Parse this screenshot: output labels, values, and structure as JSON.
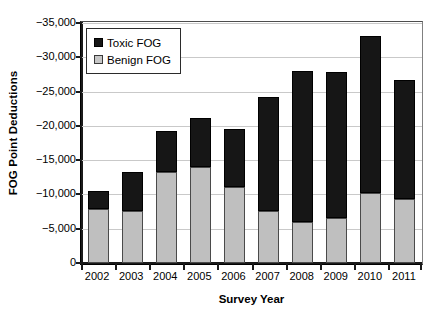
{
  "chart_data": {
    "type": "bar",
    "subtype": "stacked-vertical",
    "title": "",
    "xlabel": "Survey Year",
    "ylabel": "FOG Point Deductions",
    "categories": [
      "2002",
      "2003",
      "2004",
      "2005",
      "2006",
      "2007",
      "2008",
      "2009",
      "2010",
      "2011"
    ],
    "series": [
      {
        "name": "Benign FOG",
        "color": "#bfbfbf",
        "values": [
          -7900,
          -7600,
          -13300,
          -14000,
          -11100,
          -7600,
          -6000,
          -6600,
          -10200,
          -9300
        ]
      },
      {
        "name": "Toxic FOG",
        "color": "#161616",
        "values": [
          -2600,
          -5700,
          -5900,
          -7100,
          -8400,
          -16600,
          -22000,
          -21200,
          -22900,
          -17400
        ]
      }
    ],
    "totals": [
      -10500,
      -13300,
      -19200,
      -21100,
      -19500,
      -24200,
      -28000,
      -27800,
      -33100,
      -26700
    ],
    "ylim": [
      0,
      -35000
    ],
    "y_inverted": true,
    "yticks": [
      {
        "value": -35000,
        "label": "−35,000"
      },
      {
        "value": -30000,
        "label": "−30,000"
      },
      {
        "value": -25000,
        "label": "−25,000"
      },
      {
        "value": -20000,
        "label": "−20,000"
      },
      {
        "value": -15000,
        "label": "−15,000"
      },
      {
        "value": -10000,
        "label": "−10,000"
      },
      {
        "value": -5000,
        "label": "−5,000"
      },
      {
        "value": 0,
        "label": "0"
      }
    ],
    "grid": true,
    "grid_axis": "y",
    "legend": {
      "position": "upper-left-inside",
      "entries": [
        {
          "label": "Toxic FOG",
          "color": "#161616"
        },
        {
          "label": "Benign FOG",
          "color": "#c6c6c6"
        }
      ]
    }
  }
}
